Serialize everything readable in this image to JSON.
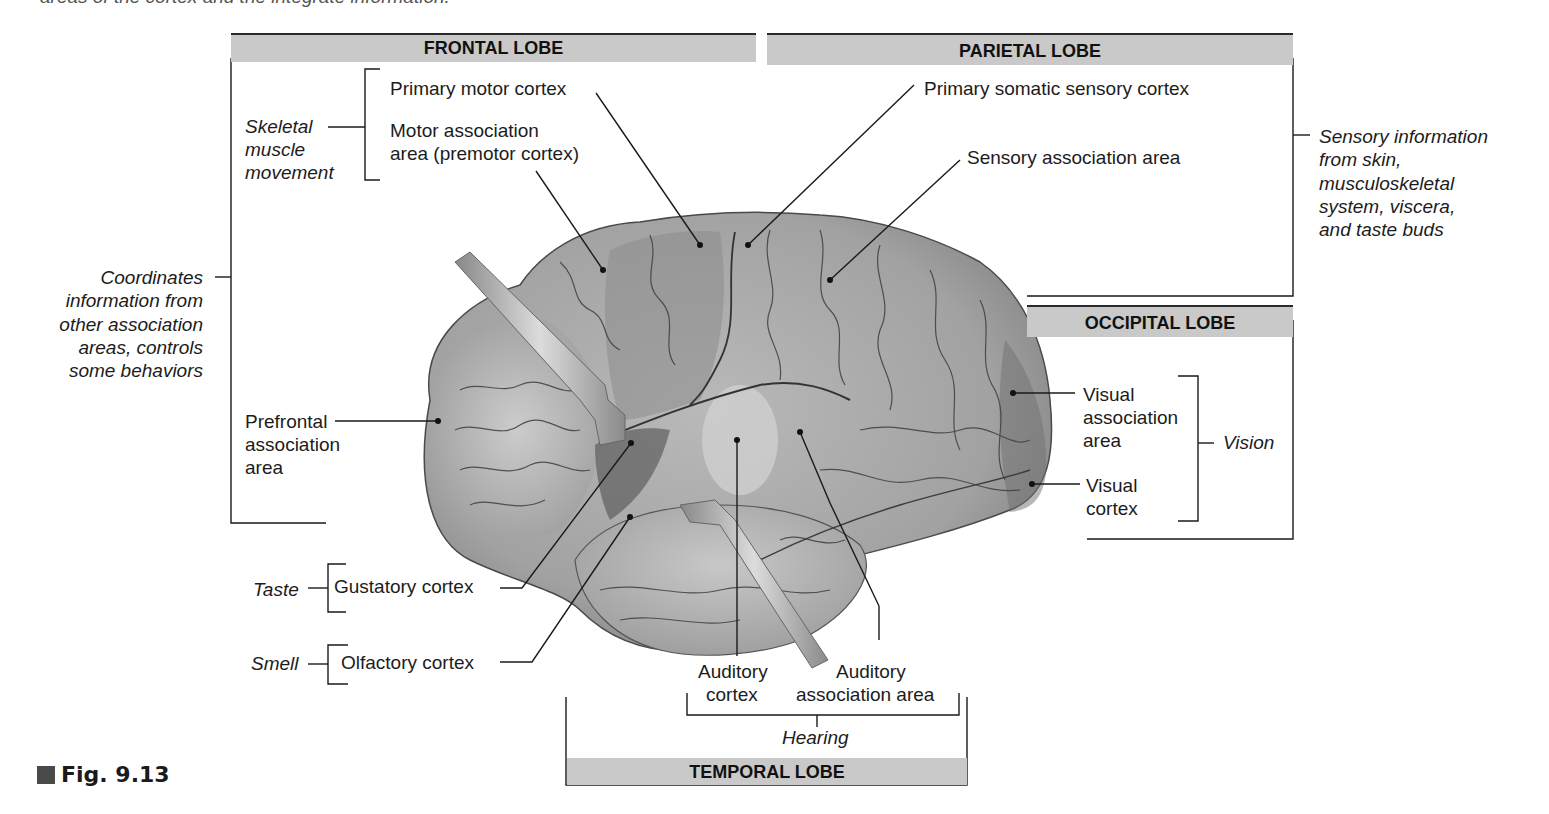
{
  "caption_cut": "areas of the cortex and the integrate information.",
  "lobes": {
    "frontal": "FRONTAL LOBE",
    "parietal": "PARIETAL LOBE",
    "occipital": "OCCIPITAL LOBE",
    "temporal": "TEMPORAL LOBE"
  },
  "labels": {
    "primary_motor": "Primary motor cortex",
    "motor_assoc_1": "Motor association",
    "motor_assoc_2": "area (premotor cortex)",
    "primary_somatic": "Primary somatic sensory cortex",
    "sensory_assoc": "Sensory association area",
    "prefrontal_1": "Prefrontal",
    "prefrontal_2": "association",
    "prefrontal_3": "area",
    "visual_assoc_1": "Visual",
    "visual_assoc_2": "association",
    "visual_assoc_3": "area",
    "visual_cortex_1": "Visual",
    "visual_cortex_2": "cortex",
    "gustatory": "Gustatory cortex",
    "olfactory": "Olfactory cortex",
    "auditory_cortex_1": "Auditory",
    "auditory_cortex_2": "cortex",
    "auditory_assoc_1": "Auditory",
    "auditory_assoc_2": "association area"
  },
  "functions": {
    "skeletal": [
      "Skeletal",
      "muscle",
      "movement"
    ],
    "coordinates": [
      "Coordinates",
      "information from",
      "other association",
      "areas, controls",
      "some behaviors"
    ],
    "sensory_info": [
      "Sensory information",
      "from skin,",
      "musculoskeletal",
      "system, viscera,",
      "and taste buds"
    ],
    "vision": "Vision",
    "taste": "Taste",
    "smell": "Smell",
    "hearing": "Hearing"
  },
  "figure": {
    "label": "Fig. 9.13"
  },
  "colors": {
    "header_bg": "#c9c9c9",
    "brain_base": "#a8a8a8",
    "brain_dark": "#7d7d7d",
    "brain_light": "#c4c4c4",
    "line": "#1a1a1a"
  }
}
